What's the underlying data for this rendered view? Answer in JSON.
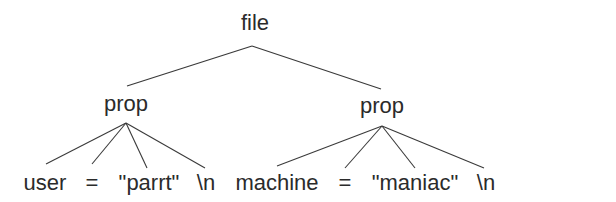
{
  "diagram": {
    "type": "parse-tree",
    "root": {
      "label": "file"
    },
    "nodes": {
      "prop_left": {
        "label": "prop"
      },
      "prop_right": {
        "label": "prop"
      }
    },
    "leaves_left": [
      "user",
      "=",
      "\"parrt\"",
      "\\n"
    ],
    "leaves_right": [
      "machine",
      "=",
      "\"maniac\"",
      "\\n"
    ],
    "line_color": "#3a3a3a"
  }
}
